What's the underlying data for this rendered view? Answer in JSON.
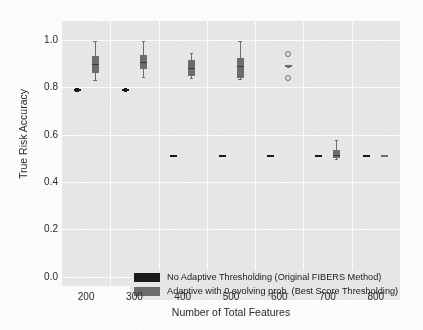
{
  "chart_data": {
    "type": "bar",
    "plot_kind": "grouped-boxplot",
    "title": "",
    "xlabel": "Number of Total Features",
    "ylabel": "True Risk Accuracy",
    "categories": [
      "200",
      "300",
      "400",
      "500",
      "600",
      "700",
      "800"
    ],
    "xtick_labels": [
      "200",
      "300",
      "400",
      "500",
      "600",
      "700",
      "800"
    ],
    "ytick_labels": [
      "1.0",
      "0.8",
      "0.6",
      "0.4",
      "0.2",
      "0.0"
    ],
    "ytick_values": [
      1.0,
      0.8,
      0.6,
      0.4,
      0.2,
      0.0
    ],
    "ylim": [
      -0.04,
      1.08
    ],
    "grid": "white gridlines on grey panel",
    "legend_position": "lower-left inside axes",
    "colors": {
      "series_1": "#1a1a1a",
      "series_2": "#6e6e6e",
      "panel_background": "#eaeaea",
      "gridline": "#ffffff",
      "figure_background": "#ffffff",
      "text": "#2b2b2b"
    },
    "series": [
      {
        "name": "No Adaptive Thresholding (Original FIBERS Method)",
        "color": "#1a1a1a",
        "boxes": [
          {
            "category": "200",
            "q1": 0.788,
            "median": 0.79,
            "q3": 0.793,
            "whisker_low": 0.786,
            "whisker_high": 0.795,
            "outliers": []
          },
          {
            "category": "300",
            "q1": 0.788,
            "median": 0.79,
            "q3": 0.793,
            "whisker_low": 0.786,
            "whisker_high": 0.795,
            "outliers": []
          },
          {
            "category": "400",
            "q1": 0.508,
            "median": 0.51,
            "q3": 0.512,
            "whisker_low": 0.508,
            "whisker_high": 0.512,
            "outliers": []
          },
          {
            "category": "500",
            "q1": 0.508,
            "median": 0.51,
            "q3": 0.512,
            "whisker_low": 0.508,
            "whisker_high": 0.512,
            "outliers": []
          },
          {
            "category": "600",
            "q1": 0.508,
            "median": 0.51,
            "q3": 0.512,
            "whisker_low": 0.508,
            "whisker_high": 0.512,
            "outliers": []
          },
          {
            "category": "700",
            "q1": 0.508,
            "median": 0.51,
            "q3": 0.512,
            "whisker_low": 0.508,
            "whisker_high": 0.512,
            "outliers": []
          },
          {
            "category": "800",
            "q1": 0.508,
            "median": 0.51,
            "q3": 0.512,
            "whisker_low": 0.508,
            "whisker_high": 0.512,
            "outliers": []
          }
        ]
      },
      {
        "name": "Adaptive with 0 evolving prob. (Best Score Thresholding)",
        "color": "#6e6e6e",
        "boxes": [
          {
            "category": "200",
            "q1": 0.862,
            "median": 0.9,
            "q3": 0.93,
            "whisker_low": 0.832,
            "whisker_high": 0.995,
            "outliers": []
          },
          {
            "category": "300",
            "q1": 0.875,
            "median": 0.905,
            "q3": 0.935,
            "whisker_low": 0.845,
            "whisker_high": 0.995,
            "outliers": []
          },
          {
            "category": "400",
            "q1": 0.848,
            "median": 0.88,
            "q3": 0.915,
            "whisker_low": 0.84,
            "whisker_high": 0.945,
            "outliers": []
          },
          {
            "category": "500",
            "q1": 0.84,
            "median": 0.89,
            "q3": 0.925,
            "whisker_low": 0.835,
            "whisker_high": 0.997,
            "outliers": []
          },
          {
            "category": "600",
            "q1": 0.885,
            "median": 0.89,
            "q3": 0.895,
            "whisker_low": 0.885,
            "whisker_high": 0.895,
            "outliers": [
              0.942,
              0.838
            ]
          },
          {
            "category": "700",
            "q1": 0.5,
            "median": 0.515,
            "q3": 0.535,
            "whisker_low": 0.498,
            "whisker_high": 0.578,
            "outliers": []
          },
          {
            "category": "800",
            "q1": 0.508,
            "median": 0.51,
            "q3": 0.512,
            "whisker_low": 0.508,
            "whisker_high": 0.512,
            "outliers": []
          }
        ]
      }
    ],
    "legend": [
      "No Adaptive Thresholding (Original FIBERS Method)",
      "Adaptive with 0 evolving prob. (Best Score Thresholding)"
    ]
  },
  "axes": {
    "ylabel": "True Risk Accuracy",
    "xlabel": "Number of Total Features"
  }
}
